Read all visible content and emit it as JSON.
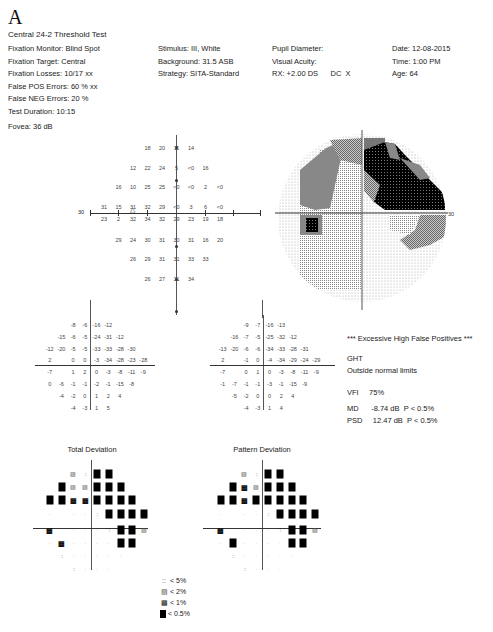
{
  "header": {
    "panel_label": "A",
    "title": "Central 24-2 Threshold Test"
  },
  "info_left": [
    "Fixation Monitor: Blind Spot",
    "Fixation Target: Central",
    "Fixation Losses: 10/17 xx",
    "False POS Errors:  60 % xx",
    "False NEG Errors:  20 %",
    "Test Duration: 10:15"
  ],
  "fovea": "Fovea: 36 dB",
  "info_mid": [
    "Stimulus: III, White",
    "Background: 31.5 ASB",
    "Strategy: SITA-Standard"
  ],
  "info_mid2": [
    "Pupil Diameter:",
    "Visual Acuity:",
    "RX: +2.00 DS      DC  X"
  ],
  "info_right": [
    "Date: 12-08-2015",
    "Time:  1:00 PM",
    "Age: 64"
  ],
  "axis_labels": {
    "left": "30",
    "right": "30"
  },
  "summary": {
    "warning": "*** Excessive High False Positives ***",
    "ght_label": "GHT",
    "ght_value": "Outside normal limits",
    "vfi": "VFI     75%",
    "md": "MD      -8.74 dB  P < 0.5%",
    "psd": "PSD     12.47 dB  P < 0.5%"
  },
  "prob_titles": {
    "total": "Total Deviation",
    "pattern": "Pattern Deviation"
  },
  "legend": [
    {
      "symbol": "::",
      "label": "< 5%"
    },
    {
      "symbol": "▨",
      "label": "< 2%"
    },
    {
      "symbol": "▩",
      "label": "< 1%"
    },
    {
      "symbol": "■",
      "label": "< 0.5%"
    }
  ],
  "chart_data": [
    {
      "type": "table",
      "title": "Threshold sensitivity (dB)",
      "rows": [
        [
          "",
          "",
          "",
          "18",
          "20",
          "11",
          "14",
          "",
          "",
          ""
        ],
        [
          "",
          "",
          "12",
          "22",
          "24",
          "5",
          "<0",
          "16",
          "",
          ""
        ],
        [
          "",
          "16",
          "10",
          "25",
          "25",
          "<0",
          "<0",
          "2",
          "<0",
          ""
        ],
        [
          "31",
          "15",
          "31",
          "32",
          "29",
          "<0",
          "3",
          "6",
          "<0",
          ""
        ],
        [
          "23",
          "2",
          "32",
          "34",
          "32",
          "29",
          "23",
          "19",
          "18",
          ""
        ],
        [
          "",
          "29",
          "24",
          "30",
          "31",
          "30",
          "31",
          "16",
          "20",
          ""
        ],
        [
          "",
          "",
          "26",
          "29",
          "31",
          "31",
          "33",
          "33",
          "",
          ""
        ],
        [
          "",
          "",
          "",
          "26",
          "27",
          "31",
          "34",
          "",
          "",
          ""
        ]
      ]
    },
    {
      "type": "table",
      "title": "Total Deviation (dB)",
      "rows": [
        [
          "",
          "",
          "",
          "-8",
          "-6",
          "-16",
          "-12",
          "",
          "",
          ""
        ],
        [
          "",
          "",
          "-15",
          "-6",
          "-5",
          "-24",
          "-31",
          "-12",
          "",
          ""
        ],
        [
          "",
          "-12",
          "-20",
          "-5",
          "-5",
          "-33",
          "-33",
          "-28",
          "-30",
          ""
        ],
        [
          "",
          "2",
          "",
          "0",
          "0",
          "-3",
          "-34",
          "-28",
          "-23",
          "-28"
        ],
        [
          "",
          "-7",
          "",
          "1",
          "2",
          "0",
          "-3",
          "-8",
          "-11",
          "-9"
        ],
        [
          "",
          "0",
          "-6",
          "-1",
          "-1",
          "-2",
          "-1",
          "-15",
          "-8",
          ""
        ],
        [
          "",
          "",
          "-4",
          "-2",
          "0",
          "1",
          "2",
          "4",
          "",
          ""
        ],
        [
          "",
          "",
          "",
          "-4",
          "-3",
          "1",
          "5",
          "",
          "",
          ""
        ]
      ]
    },
    {
      "type": "table",
      "title": "Pattern Deviation (dB)",
      "rows": [
        [
          "",
          "",
          "",
          "-9",
          "-7",
          "-16",
          "-13",
          "",
          "",
          ""
        ],
        [
          "",
          "",
          "-16",
          "-7",
          "-5",
          "-25",
          "-32",
          "-12",
          "",
          ""
        ],
        [
          "",
          "-13",
          "-20",
          "-6",
          "-6",
          "-34",
          "-33",
          "-28",
          "-31",
          ""
        ],
        [
          "",
          "2",
          "",
          "-1",
          "0",
          "-4",
          "-34",
          "-29",
          "-24",
          "-29"
        ],
        [
          "",
          "-7",
          "",
          "0",
          "1",
          "0",
          "-3",
          "-8",
          "-11",
          "-9"
        ],
        [
          "",
          "-1",
          "-7",
          "-1",
          "-1",
          "-3",
          "-1",
          "-15",
          "-9",
          ""
        ],
        [
          "",
          "",
          "-5",
          "-2",
          "0",
          "0",
          "2",
          "4",
          "",
          ""
        ],
        [
          "",
          "",
          "",
          "-4",
          "-3",
          "1",
          "4",
          "",
          "",
          ""
        ]
      ]
    },
    {
      "type": "heatmap",
      "title": "Total Deviation probability map",
      "legend": {
        "1": "normal",
        "2": "< 5%",
        "3": "< 2%",
        "4": "< 1%",
        "5": "< 0.5%"
      },
      "rows": [
        [
          0,
          0,
          0,
          3,
          2,
          5,
          5,
          0,
          0,
          0
        ],
        [
          0,
          0,
          5,
          3,
          3,
          5,
          5,
          5,
          0,
          0
        ],
        [
          0,
          5,
          5,
          4,
          4,
          5,
          5,
          5,
          5,
          0
        ],
        [
          0,
          1,
          0,
          1,
          1,
          2,
          5,
          5,
          5,
          5
        ],
        [
          0,
          4,
          0,
          1,
          1,
          1,
          2,
          5,
          5,
          3
        ],
        [
          0,
          1,
          4,
          1,
          1,
          1,
          1,
          5,
          5,
          0
        ],
        [
          0,
          0,
          2,
          1,
          1,
          1,
          1,
          1,
          0,
          0
        ],
        [
          0,
          0,
          0,
          2,
          1,
          1,
          1,
          0,
          0,
          0
        ]
      ]
    },
    {
      "type": "heatmap",
      "title": "Pattern Deviation probability map",
      "legend": {
        "1": "normal",
        "2": "< 5%",
        "3": "< 2%",
        "4": "< 1%",
        "5": "< 0.5%"
      },
      "rows": [
        [
          0,
          0,
          0,
          3,
          2,
          5,
          5,
          0,
          0,
          0
        ],
        [
          0,
          0,
          5,
          4,
          3,
          5,
          5,
          5,
          0,
          0
        ],
        [
          0,
          5,
          5,
          4,
          5,
          5,
          5,
          5,
          5,
          0
        ],
        [
          0,
          1,
          0,
          1,
          1,
          2,
          5,
          5,
          5,
          5
        ],
        [
          0,
          4,
          0,
          1,
          1,
          1,
          2,
          5,
          5,
          3
        ],
        [
          0,
          1,
          5,
          1,
          1,
          1,
          1,
          5,
          5,
          0
        ],
        [
          0,
          0,
          2,
          1,
          1,
          1,
          1,
          1,
          0,
          0
        ],
        [
          0,
          0,
          0,
          2,
          1,
          1,
          1,
          0,
          0,
          0
        ]
      ]
    }
  ]
}
